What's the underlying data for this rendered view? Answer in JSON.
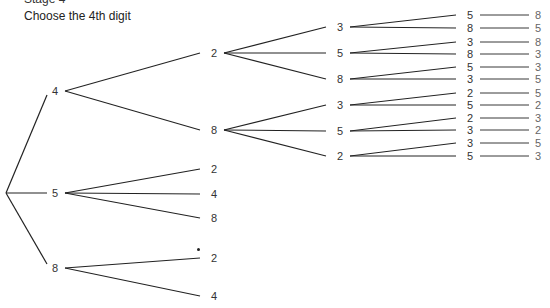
{
  "header": {
    "stage": "Stage 4",
    "title": "Choose the 4th digit"
  },
  "tree": {
    "root": {
      "x": 6,
      "y": 193
    },
    "level1": [
      {
        "id": "n4",
        "label": "4",
        "x": 55,
        "y": 91
      },
      {
        "id": "n5",
        "label": "5",
        "x": 55,
        "y": 193
      },
      {
        "id": "n8",
        "label": "8",
        "x": 55,
        "y": 268
      }
    ],
    "level2": [
      {
        "id": "n42",
        "parent": "n4",
        "label": "2",
        "x": 214,
        "y": 53
      },
      {
        "id": "n48",
        "parent": "n4",
        "label": "8",
        "x": 214,
        "y": 130
      },
      {
        "id": "n52",
        "parent": "n5",
        "label": "2",
        "x": 214,
        "y": 169
      },
      {
        "id": "n54",
        "parent": "n5",
        "label": "4",
        "x": 214,
        "y": 194
      },
      {
        "id": "n58",
        "parent": "n5",
        "label": "8",
        "x": 214,
        "y": 218
      },
      {
        "id": "n82",
        "parent": "n8",
        "label": "2",
        "x": 214,
        "y": 258
      },
      {
        "id": "n84",
        "parent": "n8",
        "label": "4",
        "x": 214,
        "y": 296
      }
    ],
    "level3": [
      {
        "id": "n423",
        "parent": "n42",
        "label": "3",
        "x": 340,
        "y": 27
      },
      {
        "id": "n425",
        "parent": "n42",
        "label": "5",
        "x": 340,
        "y": 53
      },
      {
        "id": "n428",
        "parent": "n42",
        "label": "8",
        "x": 340,
        "y": 79
      },
      {
        "id": "n483",
        "parent": "n48",
        "label": "3",
        "x": 340,
        "y": 105
      },
      {
        "id": "n485",
        "parent": "n48",
        "label": "5",
        "x": 340,
        "y": 131
      },
      {
        "id": "n482",
        "parent": "n48",
        "label": "2",
        "x": 340,
        "y": 156
      }
    ],
    "level4": [
      {
        "parent": "n423",
        "label": "5",
        "x": 470,
        "y": 15,
        "leaf": "8"
      },
      {
        "parent": "n423",
        "label": "8",
        "x": 470,
        "y": 28,
        "leaf": "5"
      },
      {
        "parent": "n425",
        "label": "3",
        "x": 470,
        "y": 42,
        "leaf": "8"
      },
      {
        "parent": "n425",
        "label": "8",
        "x": 470,
        "y": 54,
        "leaf": "3"
      },
      {
        "parent": "n428",
        "label": "5",
        "x": 470,
        "y": 67,
        "leaf": "3"
      },
      {
        "parent": "n428",
        "label": "3",
        "x": 470,
        "y": 79,
        "leaf": "5"
      },
      {
        "parent": "n483",
        "label": "2",
        "x": 470,
        "y": 93,
        "leaf": "5"
      },
      {
        "parent": "n483",
        "label": "5",
        "x": 470,
        "y": 105,
        "leaf": "2"
      },
      {
        "parent": "n485",
        "label": "2",
        "x": 470,
        "y": 118,
        "leaf": "3"
      },
      {
        "parent": "n485",
        "label": "3",
        "x": 470,
        "y": 130,
        "leaf": "2"
      },
      {
        "parent": "n482",
        "label": "3",
        "x": 470,
        "y": 143,
        "leaf": "5"
      },
      {
        "parent": "n482",
        "label": "5",
        "x": 470,
        "y": 156,
        "leaf": "3"
      }
    ],
    "leaf_x": 538,
    "line_color": "#222222"
  }
}
